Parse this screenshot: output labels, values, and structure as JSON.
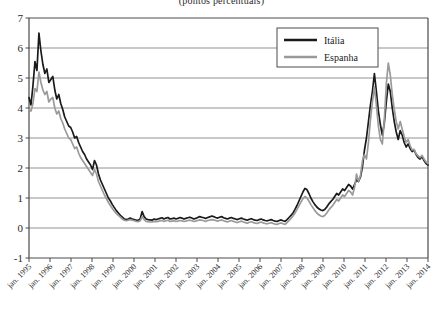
{
  "subtitle": "(pontos percentuais)",
  "legend": {
    "position": "top-right",
    "items": [
      {
        "label": "Itália",
        "color": "#1a1a1a"
      },
      {
        "label": "Espanha",
        "color": "#9a9a9a"
      }
    ]
  },
  "chart_data": {
    "type": "line",
    "title": "",
    "subtitle": "(pontos percentuais)",
    "xlabel": "",
    "ylabel": "",
    "ylim": [
      -1,
      7
    ],
    "yticks": [
      -1,
      0,
      1,
      2,
      3,
      4,
      5,
      6,
      7
    ],
    "ytick_labels": [
      "-1",
      "0",
      "1",
      "2",
      "3",
      "4",
      "5",
      "6",
      "7"
    ],
    "grid": true,
    "xticks": [
      "jan. 1995",
      "jan. 1996",
      "jan. 1997",
      "jan. 1998",
      "jan. 1999",
      "jan. 2000",
      "jan. 2001",
      "jan. 2002",
      "jan. 2003",
      "jan. 2004",
      "jan. 2005",
      "jan. 2006",
      "jan. 2007",
      "jan. 2008",
      "jan. 2009",
      "jan. 2010",
      "jan. 2011",
      "jan. 2012",
      "jan. 2013",
      "jan. 2014"
    ],
    "xlim": [
      "jan. 1995",
      "jan. 2014"
    ],
    "series": [
      {
        "name": "Itália",
        "color": "#1a1a1a",
        "values": [
          4.35,
          4.1,
          4.75,
          5.55,
          5.25,
          6.5,
          5.9,
          5.45,
          5.15,
          5.3,
          4.85,
          4.95,
          5.05,
          4.6,
          4.3,
          4.45,
          4.15,
          3.95,
          3.7,
          3.55,
          3.4,
          3.35,
          3.2,
          3.0,
          3.05,
          2.85,
          2.7,
          2.55,
          2.45,
          2.3,
          2.2,
          2.1,
          1.95,
          2.25,
          2.1,
          1.8,
          1.6,
          1.45,
          1.3,
          1.15,
          1.0,
          0.9,
          0.78,
          0.68,
          0.58,
          0.5,
          0.42,
          0.36,
          0.3,
          0.28,
          0.3,
          0.33,
          0.3,
          0.28,
          0.26,
          0.25,
          0.3,
          0.55,
          0.38,
          0.3,
          0.28,
          0.27,
          0.26,
          0.3,
          0.28,
          0.3,
          0.32,
          0.34,
          0.3,
          0.33,
          0.35,
          0.3,
          0.31,
          0.33,
          0.3,
          0.32,
          0.35,
          0.33,
          0.3,
          0.32,
          0.34,
          0.36,
          0.33,
          0.3,
          0.32,
          0.35,
          0.38,
          0.36,
          0.34,
          0.32,
          0.35,
          0.37,
          0.4,
          0.38,
          0.35,
          0.33,
          0.36,
          0.38,
          0.34,
          0.32,
          0.3,
          0.33,
          0.35,
          0.32,
          0.3,
          0.28,
          0.31,
          0.33,
          0.3,
          0.28,
          0.26,
          0.29,
          0.31,
          0.28,
          0.26,
          0.25,
          0.28,
          0.3,
          0.27,
          0.25,
          0.24,
          0.26,
          0.28,
          0.25,
          0.23,
          0.22,
          0.25,
          0.27,
          0.24,
          0.22,
          0.28,
          0.35,
          0.42,
          0.5,
          0.62,
          0.75,
          0.9,
          1.05,
          1.2,
          1.32,
          1.28,
          1.15,
          1.0,
          0.88,
          0.78,
          0.7,
          0.64,
          0.6,
          0.58,
          0.62,
          0.7,
          0.8,
          0.88,
          0.95,
          1.05,
          1.15,
          1.1,
          1.2,
          1.3,
          1.25,
          1.35,
          1.45,
          1.4,
          1.3,
          1.45,
          1.6,
          1.55,
          1.7,
          2.05,
          2.6,
          3.0,
          3.55,
          4.1,
          4.55,
          5.15,
          4.55,
          3.9,
          3.45,
          3.1,
          3.5,
          4.2,
          4.8,
          4.55,
          4.0,
          3.55,
          3.2,
          2.95,
          3.25,
          3.1,
          2.85,
          2.7,
          2.8,
          2.65,
          2.55,
          2.6,
          2.45,
          2.35,
          2.3,
          2.38,
          2.25,
          2.15,
          2.1
        ]
      },
      {
        "name": "Espanha",
        "color": "#9a9a9a",
        "values": [
          3.95,
          3.9,
          4.15,
          4.65,
          4.55,
          5.2,
          4.85,
          4.6,
          4.45,
          4.55,
          4.2,
          4.3,
          4.35,
          4.0,
          3.8,
          3.9,
          3.65,
          3.5,
          3.3,
          3.15,
          3.0,
          2.95,
          2.8,
          2.65,
          2.7,
          2.5,
          2.35,
          2.25,
          2.15,
          2.05,
          1.95,
          1.85,
          1.75,
          1.95,
          1.8,
          1.55,
          1.4,
          1.25,
          1.1,
          0.98,
          0.85,
          0.75,
          0.65,
          0.56,
          0.48,
          0.42,
          0.36,
          0.3,
          0.26,
          0.24,
          0.26,
          0.28,
          0.26,
          0.24,
          0.22,
          0.21,
          0.24,
          0.38,
          0.28,
          0.22,
          0.21,
          0.2,
          0.2,
          0.22,
          0.21,
          0.22,
          0.24,
          0.25,
          0.22,
          0.24,
          0.26,
          0.22,
          0.23,
          0.24,
          0.22,
          0.23,
          0.25,
          0.24,
          0.22,
          0.23,
          0.25,
          0.26,
          0.24,
          0.22,
          0.23,
          0.25,
          0.27,
          0.26,
          0.24,
          0.22,
          0.25,
          0.26,
          0.28,
          0.27,
          0.25,
          0.23,
          0.25,
          0.27,
          0.24,
          0.22,
          0.2,
          0.23,
          0.25,
          0.22,
          0.2,
          0.18,
          0.21,
          0.23,
          0.2,
          0.18,
          0.16,
          0.19,
          0.21,
          0.18,
          0.16,
          0.15,
          0.18,
          0.2,
          0.17,
          0.15,
          0.14,
          0.16,
          0.18,
          0.15,
          0.13,
          0.12,
          0.15,
          0.17,
          0.14,
          0.12,
          0.18,
          0.25,
          0.32,
          0.4,
          0.5,
          0.62,
          0.74,
          0.86,
          0.98,
          1.05,
          1.0,
          0.9,
          0.78,
          0.68,
          0.58,
          0.5,
          0.44,
          0.4,
          0.38,
          0.42,
          0.5,
          0.6,
          0.68,
          0.75,
          0.85,
          0.95,
          0.9,
          1.0,
          1.1,
          1.05,
          1.15,
          1.25,
          1.2,
          1.1,
          1.35,
          1.8,
          1.55,
          1.75,
          2.25,
          2.45,
          2.3,
          2.85,
          3.6,
          4.2,
          4.7,
          4.1,
          3.4,
          2.95,
          2.8,
          3.6,
          4.8,
          5.5,
          5.1,
          4.45,
          3.95,
          3.55,
          3.3,
          3.55,
          3.3,
          3.05,
          2.85,
          2.95,
          2.75,
          2.6,
          2.62,
          2.48,
          2.4,
          2.35,
          2.42,
          2.3,
          2.2,
          2.15
        ]
      }
    ]
  }
}
